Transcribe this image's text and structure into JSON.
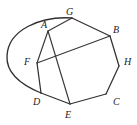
{
  "figure": {
    "kind": "geometry-diagram",
    "title": "",
    "stroke_color": "#33302f",
    "background_color": "#ffffff",
    "width": 137,
    "height": 125,
    "labels": [
      {
        "text": "A",
        "x": 41,
        "y": 20
      },
      {
        "text": "G",
        "x": 66,
        "y": 7
      },
      {
        "text": "B",
        "x": 113,
        "y": 25
      },
      {
        "text": "H",
        "x": 124,
        "y": 57
      },
      {
        "text": "C",
        "x": 113,
        "y": 97
      },
      {
        "text": "E",
        "x": 65,
        "y": 110
      },
      {
        "text": "D",
        "x": 33,
        "y": 97
      },
      {
        "text": "F",
        "x": 24,
        "y": 57
      }
    ],
    "vertices": [
      {
        "name": "A",
        "x": 48,
        "y": 31
      },
      {
        "name": "G",
        "x": 72,
        "y": 18
      },
      {
        "name": "B",
        "x": 110,
        "y": 36
      },
      {
        "name": "H",
        "x": 119,
        "y": 66
      },
      {
        "name": "C",
        "x": 106,
        "y": 94
      },
      {
        "name": "E",
        "x": 70,
        "y": 104
      },
      {
        "name": "D",
        "x": 41,
        "y": 93
      },
      {
        "name": "F",
        "x": 37,
        "y": 63
      }
    ],
    "edges": [
      {
        "name": "edge-G-B",
        "from": "G",
        "to": "B"
      },
      {
        "name": "edge-B-H",
        "from": "B",
        "to": "H"
      },
      {
        "name": "edge-H-C",
        "from": "H",
        "to": "C"
      },
      {
        "name": "edge-C-E",
        "from": "C",
        "to": "E"
      },
      {
        "name": "edge-E-D",
        "from": "E",
        "to": "D"
      },
      {
        "name": "edge-D-F",
        "from": "D",
        "to": "F"
      },
      {
        "name": "edge-A-G",
        "from": "A",
        "to": "G"
      },
      {
        "name": "edge-A-F",
        "from": "A",
        "to": "F"
      },
      {
        "name": "edge-A-E",
        "from": "A",
        "to": "E"
      },
      {
        "name": "edge-F-B",
        "from": "F",
        "to": "B"
      }
    ],
    "arcs": [
      {
        "name": "arc-G-to-D",
        "path": "M 72 18 C 40 16, 8 30, 7 56 C 6 74, 24 86, 41 93"
      }
    ]
  }
}
